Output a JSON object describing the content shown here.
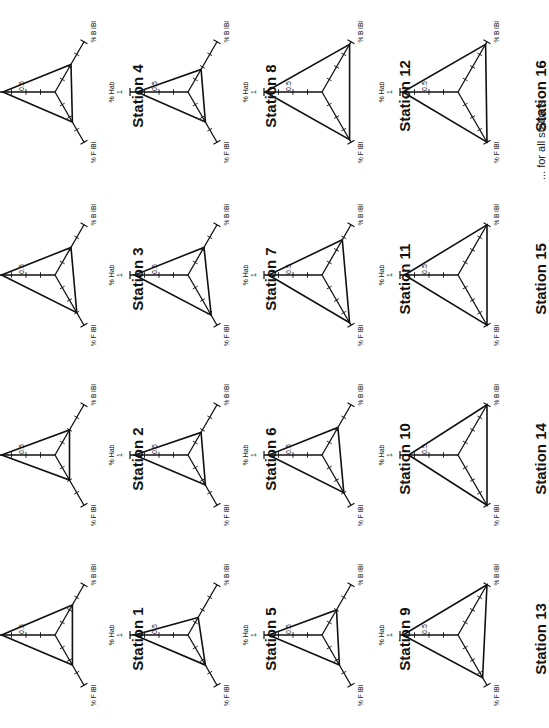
{
  "figure": {
    "caption_fragment": "... for all stations",
    "axis_labels": {
      "hab": "% Hab",
      "fibi": "% F IBI",
      "bibi": "% B IBI"
    },
    "tick_labels": {
      "mid": "0.5",
      "max": "1"
    }
  },
  "chart_data": [
    {
      "type": "radar",
      "title": "Station 1",
      "axes": [
        "% Hab",
        "% F IBI",
        "% B IBI"
      ],
      "values": [
        0.92,
        0.6,
        0.6
      ],
      "range": [
        0,
        1
      ]
    },
    {
      "type": "radar",
      "title": "Station 2",
      "axes": [
        "% Hab",
        "% F IBI",
        "% B IBI"
      ],
      "values": [
        0.92,
        0.5,
        0.5
      ],
      "range": [
        0,
        1
      ]
    },
    {
      "type": "radar",
      "title": "Station 3",
      "axes": [
        "% Hab",
        "% F IBI",
        "% B IBI"
      ],
      "values": [
        0.92,
        0.75,
        0.55
      ],
      "range": [
        0,
        1
      ]
    },
    {
      "type": "radar",
      "title": "Station 4",
      "axes": [
        "% Hab",
        "% F IBI",
        "% B IBI"
      ],
      "values": [
        0.9,
        0.6,
        0.55
      ],
      "range": [
        0,
        1
      ]
    },
    {
      "type": "radar",
      "title": "Station 5",
      "axes": [
        "% Hab",
        "% F IBI",
        "% B IBI"
      ],
      "values": [
        0.92,
        0.6,
        0.35
      ],
      "range": [
        0,
        1
      ]
    },
    {
      "type": "radar",
      "title": "Station 6",
      "axes": [
        "% Hab",
        "% F IBI",
        "% B IBI"
      ],
      "values": [
        0.92,
        0.6,
        0.45
      ],
      "range": [
        0,
        1
      ]
    },
    {
      "type": "radar",
      "title": "Station 7",
      "axes": [
        "% Hab",
        "% F IBI",
        "% B IBI"
      ],
      "values": [
        0.92,
        0.8,
        0.55
      ],
      "range": [
        0,
        1
      ]
    },
    {
      "type": "radar",
      "title": "Station 8",
      "axes": [
        "% Hab",
        "% F IBI",
        "% B IBI"
      ],
      "values": [
        0.88,
        0.6,
        0.45
      ],
      "range": [
        0,
        1
      ]
    },
    {
      "type": "radar",
      "title": "Station 9",
      "axes": [
        "% Hab",
        "% F IBI",
        "% B IBI"
      ],
      "values": [
        0.92,
        0.6,
        0.5
      ],
      "range": [
        0,
        1
      ]
    },
    {
      "type": "radar",
      "title": "Station 10",
      "axes": [
        "% Hab",
        "% F IBI",
        "% B IBI"
      ],
      "values": [
        0.92,
        0.75,
        0.55
      ],
      "range": [
        0,
        1
      ]
    },
    {
      "type": "radar",
      "title": "Station 11",
      "axes": [
        "% Hab",
        "% F IBI",
        "% B IBI"
      ],
      "values": [
        0.92,
        0.95,
        0.7
      ],
      "range": [
        0,
        1
      ]
    },
    {
      "type": "radar",
      "title": "Station 12",
      "axes": [
        "% Hab",
        "% F IBI",
        "% B IBI"
      ],
      "values": [
        0.98,
        0.95,
        0.95
      ],
      "range": [
        0,
        1
      ]
    },
    {
      "type": "radar",
      "title": "Station 13",
      "axes": [
        "% Hab",
        "% F IBI",
        "% B IBI"
      ],
      "values": [
        0.95,
        0.85,
        1.0
      ],
      "range": [
        0,
        1
      ]
    },
    {
      "type": "radar",
      "title": "Station 14",
      "axes": [
        "% Hab",
        "% F IBI",
        "% B IBI"
      ],
      "values": [
        0.85,
        1.0,
        1.0
      ],
      "range": [
        0,
        1
      ]
    },
    {
      "type": "radar",
      "title": "Station 15",
      "axes": [
        "% Hab",
        "% F IBI",
        "% B IBI"
      ],
      "values": [
        0.92,
        1.0,
        1.0
      ],
      "range": [
        0,
        1
      ]
    },
    {
      "type": "radar",
      "title": "Station 16",
      "axes": [
        "% Hab",
        "% F IBI",
        "% B IBI"
      ],
      "values": [
        0.95,
        1.0,
        0.95
      ],
      "range": [
        0,
        1
      ]
    }
  ],
  "layout": {
    "columns_x": [
      55,
      188,
      322,
      458
    ],
    "rows_y": [
      92,
      275,
      455,
      635
    ],
    "grid": [
      [
        4,
        8,
        12,
        16
      ],
      [
        3,
        7,
        11,
        15
      ],
      [
        2,
        6,
        10,
        14
      ],
      [
        1,
        5,
        9,
        13
      ]
    ],
    "radius": 58
  }
}
